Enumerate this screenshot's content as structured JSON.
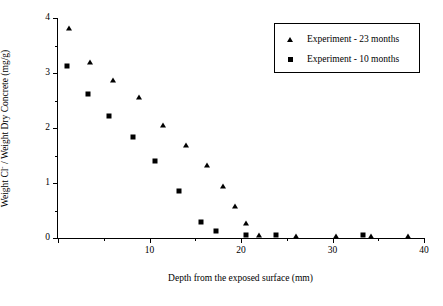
{
  "chart_data": {
    "type": "scatter",
    "title": "",
    "xlabel": "Depth from the exposed surface (mm)",
    "ylabel": "Weight Cl⁻ / Weight Dry Concrete (mg/g)",
    "ylabel_parts": {
      "pre": "Weight Cl",
      "sup": "-",
      "post": " / Weight Dry Concrete (mg/g)"
    },
    "xlim": [
      0,
      40
    ],
    "ylim": [
      0,
      4
    ],
    "grid": false,
    "legend_position": "top-right",
    "x_major_ticks": [
      0,
      10,
      20,
      30,
      40
    ],
    "x_major_ticklabels": [
      "",
      "10",
      "20",
      "30",
      "40"
    ],
    "x_minor_ticks": [
      5,
      15,
      25,
      35
    ],
    "y_major_ticks": [
      0,
      1,
      2,
      3,
      4
    ],
    "y_major_ticklabels": [
      "0",
      "1",
      "2",
      "3",
      "4"
    ],
    "y_minor_ticks": [
      0.5,
      1.5,
      2.5,
      3.5
    ],
    "series": [
      {
        "name": "Experiment - 23 months",
        "marker": "triangle",
        "color": "#000000",
        "points": [
          [
            1.2,
            3.82
          ],
          [
            3.5,
            3.2
          ],
          [
            6.0,
            2.87
          ],
          [
            8.8,
            2.56
          ],
          [
            11.5,
            2.05
          ],
          [
            14.0,
            1.7
          ],
          [
            16.3,
            1.33
          ],
          [
            18.0,
            0.94
          ],
          [
            19.3,
            0.58
          ],
          [
            20.6,
            0.27
          ],
          [
            22.0,
            0.05
          ],
          [
            26.0,
            0.04
          ],
          [
            30.4,
            0.04
          ],
          [
            34.2,
            0.04
          ],
          [
            38.2,
            0.04
          ]
        ]
      },
      {
        "name": "Experiment - 10 months",
        "marker": "square",
        "color": "#000000",
        "points": [
          [
            1.0,
            3.13
          ],
          [
            3.3,
            2.62
          ],
          [
            5.6,
            2.21
          ],
          [
            8.2,
            1.84
          ],
          [
            10.6,
            1.4
          ],
          [
            13.2,
            0.85
          ],
          [
            15.6,
            0.3
          ],
          [
            17.3,
            0.13
          ],
          [
            20.6,
            0.05
          ],
          [
            23.8,
            0.05
          ],
          [
            33.3,
            0.05
          ]
        ]
      }
    ]
  },
  "legend": {
    "entries": [
      {
        "label": "Experiment - 23 months",
        "marker": "triangle"
      },
      {
        "label": "Experiment - 10 months",
        "marker": "square"
      }
    ]
  }
}
